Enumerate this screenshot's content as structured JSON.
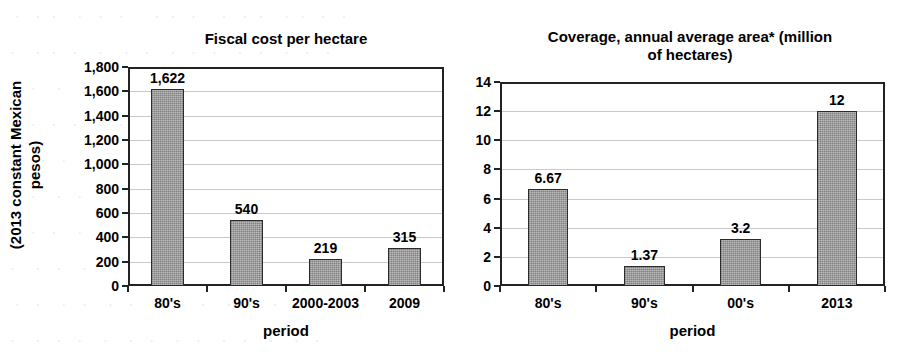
{
  "background_ghost_lines": [
    "   ·   ·  ·    ·   ·   ·      ·  ·   ·     ·   ·  ·    ·  ·   ·   ·",
    "  ·    ·  ·   ·    ·    ·   ·    ·   ·   ·    ·   ·    ·   ·   ·",
    "   ·  ·    ·    ·    ·   ·    ·  ·     ·    ·   ·   ·     ·  ·",
    "  ·   ·   ·   ·    ·   ·   ·    ·   ·    ·   ·     ·   ·   ·   ·",
    "   ·    ·   ·    ·   ·    ·   ·   ·   ·    ·    ·   ·   ·    ·",
    "  ·   ·    ·   ·    ·    ·    ·   ·    ·   ·   ·    ·   ·    ·  ·",
    "   ·  ·   ·    ·   ·   ·   ·    ·    ·   ·    ·   ·    ·   ·",
    "  ·    ·   ·    ·    ·   ·    ·   ·   ·    ·    ·   ·    ·   ·   ·",
    "   ·   ·    ·   ·    ·   ·    ·    ·   ·    ·   ·    ·   ·    ·",
    "  ·    ·   ·   ·    ·    ·   ·    ·   ·    ·   ·    ·    ·   ·"
  ],
  "colors": {
    "bar_fill": "#8f8f8f",
    "bar_border": "#2b2b2b",
    "axis": "#222222",
    "gridline": "#c9c9c9",
    "text": "#000000",
    "background": "#ffffff"
  },
  "chart_data": [
    {
      "id": "fiscal-cost",
      "type": "bar",
      "title": "Fiscal cost per hectare",
      "xlabel": "period",
      "ylabel": "(2013 constant Mexican\npesos)",
      "categories": [
        "80's",
        "90's",
        "2000-2003",
        "2009"
      ],
      "values": [
        1622,
        540,
        219,
        315
      ],
      "value_labels": [
        "1,622",
        "540",
        "219",
        "315"
      ],
      "ylim": [
        0,
        1800
      ],
      "ytick_step": 200,
      "ytick_labels": [
        "0",
        "200",
        "400",
        "600",
        "800",
        "1,000",
        "1,200",
        "1,400",
        "1,600",
        "1,800"
      ],
      "grid": true,
      "legend": "none"
    },
    {
      "id": "coverage-area",
      "type": "bar",
      "title": "Coverage, annual average area* (million of hectares)",
      "title_lines": [
        "Coverage, annual average area* (million",
        "of hectares)"
      ],
      "xlabel": "period",
      "ylabel": "",
      "categories": [
        "80's",
        "90's",
        "00's",
        "2013"
      ],
      "values": [
        6.67,
        1.37,
        3.2,
        12
      ],
      "value_labels": [
        "6.67",
        "1.37",
        "3.2",
        "12"
      ],
      "ylim": [
        0,
        14
      ],
      "ytick_step": 2,
      "ytick_labels": [
        "0",
        "2",
        "4",
        "6",
        "8",
        "10",
        "12",
        "14"
      ],
      "grid": true,
      "legend": "none"
    }
  ]
}
